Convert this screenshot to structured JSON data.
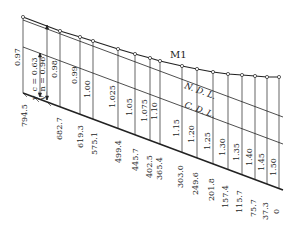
{
  "diagram": {
    "curve_label": "M1",
    "ndl_label": "N. D. L.",
    "cdl_label": "C. D. L.",
    "yc_label": "y_c = 0.63",
    "yn_label": "y_n = 0.96",
    "depths": [
      "0.97",
      "0.98",
      "0.99",
      "1.00",
      "1.025",
      "1.05",
      "1.075",
      "1.10",
      "1.15",
      "1.20",
      "1.25",
      "1.30",
      "1.35",
      "1.40",
      "1.45",
      "1.50"
    ],
    "distances": [
      "794.5",
      "682.7",
      "619.3",
      "575.1",
      "499.4",
      "445.7",
      "402.5",
      "365.4",
      "303.0",
      "249.6",
      "201.8",
      "157.4",
      "115.7",
      "75.7",
      "37.3",
      "0"
    ]
  },
  "colors": {
    "line": "#222222",
    "background": "#ffffff"
  }
}
